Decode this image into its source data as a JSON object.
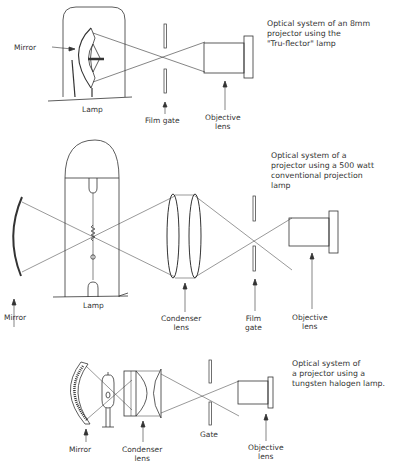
{
  "figures": [
    {
      "id": "tru-flector",
      "caption": "Optical system of an 8mm\nprojector using the\n\"Tru-flector\" lamp",
      "labels": {
        "mirror": "Mirror",
        "lamp": "Lamp",
        "film_gate": "Film gate",
        "objective_lens": "Objective\nlens"
      }
    },
    {
      "id": "500-watt",
      "caption": "Optical system of a\nprojector using a 500 watt\nconventional projection\nlamp",
      "labels": {
        "mirror": "Mirror",
        "lamp": "Lamp",
        "condenser_lens": "Condenser\nlens",
        "film_gate": "Film\ngate",
        "objective_lens": "Objective\nlens"
      }
    },
    {
      "id": "tungsten-halogen",
      "caption": "Optical system of\na projector using a\ntungsten halogen lamp.",
      "labels": {
        "mirror": "Mirror",
        "condenser_lens": "Condenser\nlens",
        "gate": "Gate",
        "objective_lens": "Objective\nlens"
      }
    }
  ],
  "colors": {
    "line": "#333333",
    "background": "#ffffff"
  }
}
